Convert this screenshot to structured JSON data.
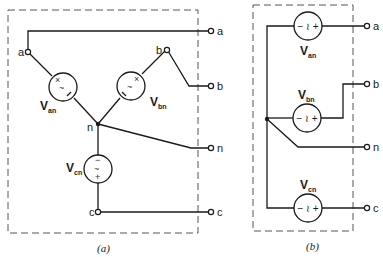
{
  "figure_a": {
    "caption": "(a)",
    "node_labels": {
      "a": "a",
      "b": "b",
      "n": "n",
      "c": "c"
    },
    "terminal_labels": {
      "a": "a",
      "b": "b",
      "n": "n",
      "c": "c"
    },
    "sources": [
      {
        "name": "V",
        "sub": "an",
        "symbols": [
          "×",
          "~",
          "="
        ]
      },
      {
        "name": "V",
        "sub": "bn",
        "symbols": [
          "×",
          "~",
          "="
        ]
      },
      {
        "name": "V",
        "sub": "cn",
        "symbols": [
          "−",
          "~",
          "+"
        ]
      }
    ]
  },
  "figure_b": {
    "caption": "(b)",
    "terminal_labels": {
      "a": "a",
      "b": "b",
      "n": "n",
      "c": "c"
    },
    "source_symbol": "− ≀ +",
    "sources": [
      {
        "name": "V",
        "sub": "an"
      },
      {
        "name": "V",
        "sub": "bn"
      },
      {
        "name": "V",
        "sub": "cn"
      }
    ]
  }
}
